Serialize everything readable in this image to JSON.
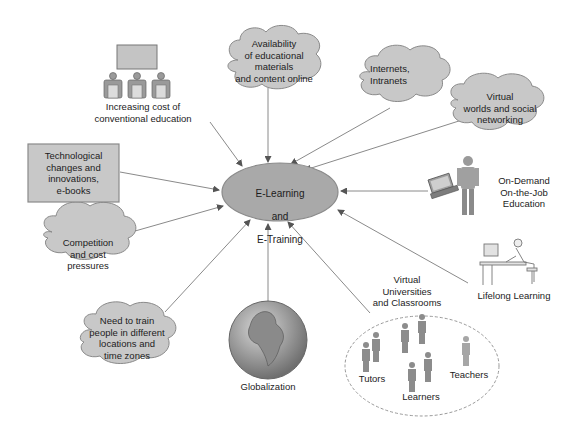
{
  "center": {
    "line1": "E-Learning",
    "line2": "and",
    "line3": "E-Training"
  },
  "nodes": {
    "conventional": "Increasing cost of\nconventional education",
    "availability": "Availability\nof educational\nmaterials\nand content online",
    "internets": "Internets,\nIntranets",
    "virtual_worlds": "Virtual\nworlds and social\nnetworking",
    "technological": "Technological\nchanges and\ninnovations,\ne-books",
    "on_demand": "On-Demand\nOn-the-Job\nEducation",
    "competition": "Competition\nand cost\npressures",
    "lifelong": "Lifelong Learning",
    "need_to_train": "Need to train\npeople in different\nlocations and\ntime zones",
    "globalization": "Globalization",
    "virtual_universities": "Virtual\nUniversities\nand Classrooms",
    "tutors": "Tutors",
    "learners": "Learners",
    "teachers": "Teachers"
  },
  "colors": {
    "fill": "#c8c8c8",
    "stroke": "#8a8a8a",
    "line": "#888888",
    "ellipse": "#a9a9a9"
  }
}
